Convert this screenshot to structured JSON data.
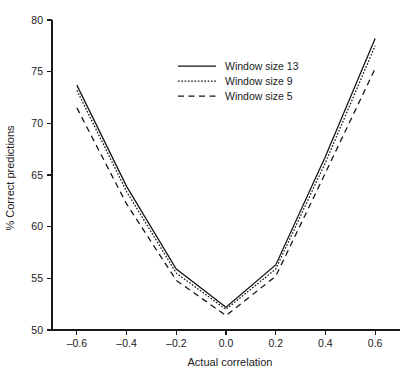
{
  "chart_data": {
    "type": "line",
    "title": "",
    "xlabel": "Actual correlation",
    "ylabel": "% Correct predictions",
    "xlim": [
      -0.7,
      0.7
    ],
    "ylim": [
      50,
      80
    ],
    "grid": false,
    "legend_position": "top-center",
    "x": [
      -0.6,
      -0.4,
      -0.2,
      0.0,
      0.2,
      0.4,
      0.6
    ],
    "xticks": [
      "–0.6",
      "–0.4",
      "–0.2",
      "0.0",
      "0.2",
      "0.4",
      "0.6"
    ],
    "xtick_values": [
      -0.6,
      -0.4,
      -0.2,
      0.0,
      0.2,
      0.4,
      0.6
    ],
    "yticks": [
      "50",
      "55",
      "60",
      "65",
      "70",
      "75",
      "80"
    ],
    "ytick_values": [
      50,
      55,
      60,
      65,
      70,
      75,
      80
    ],
    "series": [
      {
        "name": "Window size 13",
        "style": "solid",
        "values": [
          73.7,
          63.9,
          55.9,
          52.2,
          56.3,
          66.8,
          78.2
        ]
      },
      {
        "name": "Window size 9",
        "style": "dotted",
        "values": [
          73.2,
          63.4,
          55.5,
          52.0,
          55.9,
          66.2,
          77.5
        ]
      },
      {
        "name": "Window size 5",
        "style": "dashed",
        "values": [
          71.5,
          62.2,
          54.8,
          51.4,
          55.2,
          65.2,
          75.3
        ]
      }
    ]
  },
  "legend": {
    "items": [
      {
        "label": "Window size 13",
        "style": "solid"
      },
      {
        "label": "Window size 9",
        "style": "dotted"
      },
      {
        "label": "Window size 5",
        "style": "dashed"
      }
    ]
  },
  "colors": {
    "line": "#111111",
    "axis": "#1a1a1a",
    "text": "#1a1a1a",
    "background": "#ffffff"
  }
}
